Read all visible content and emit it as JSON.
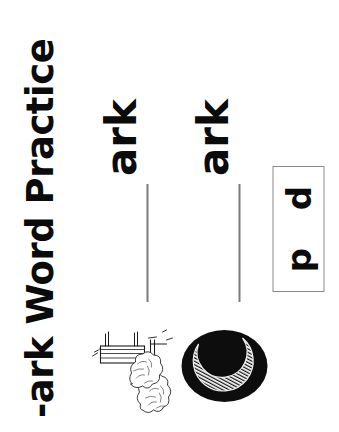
{
  "worksheet": {
    "title": "-ark Word Practice",
    "word_family": "-ark",
    "rows": [
      {
        "picture_name": "park-bench-with-trees-illustration",
        "answer_word": "park",
        "blank_line_label": "",
        "ending": "ark"
      },
      {
        "picture_name": "crescent-moon-dark-night-illustration",
        "answer_word": "dark",
        "blank_line_label": "",
        "ending": "ark"
      }
    ],
    "letter_bank": {
      "name": "letter-bank",
      "letters": [
        "p",
        "d"
      ]
    }
  },
  "colors": {
    "ink": "#0b0b0b",
    "line_gray": "#7b7b7b",
    "box_border": "#8a8a8a",
    "paper": "#ffffff"
  }
}
